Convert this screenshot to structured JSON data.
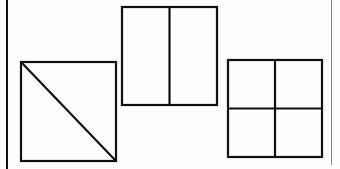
{
  "figure": {
    "stroke_color": "#111111",
    "background": "#fdfdfd",
    "shapes": [
      {
        "id": "square-diagonal",
        "type": "square",
        "division": "diagonal",
        "parts": 2,
        "x": 21,
        "y": 62,
        "width": 95,
        "height": 99
      },
      {
        "id": "rectangle-halves",
        "type": "rectangle",
        "division": "vertical-halves",
        "parts": 2,
        "x": 122,
        "y": 7,
        "width": 95,
        "height": 98
      },
      {
        "id": "square-quarters",
        "type": "square",
        "division": "quarters",
        "parts": 4,
        "x": 228,
        "y": 60,
        "width": 94,
        "height": 97
      }
    ]
  }
}
